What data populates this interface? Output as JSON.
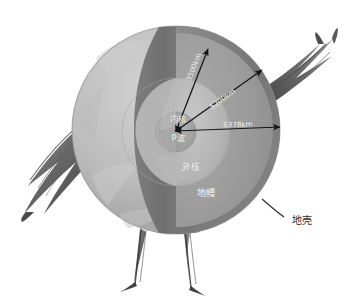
{
  "figure": {
    "style": "hand-drawn pencil sketch, grayscale",
    "background_color": "#ffffff"
  },
  "layers": [
    {
      "id": "crust",
      "label": "地壳",
      "color": "#7b7b7b",
      "label_color": "#3a3a3a"
    },
    {
      "id": "mantle",
      "label": "地幔",
      "color": "#9a9a9a",
      "label_color": "#ffffff"
    },
    {
      "id": "outer_core",
      "label": "外核",
      "color": "#b4b4b4",
      "label_color": "#ffffff"
    },
    {
      "id": "inner_core",
      "label": "内核",
      "color": "#a2a2a2",
      "label_color": "#ffffff"
    }
  ],
  "wave_labels": [
    {
      "id": "p_wave",
      "label": "P波",
      "color": "#ffffff"
    }
  ],
  "measurements": [
    {
      "id": "inner_core_radius",
      "label": "3500km",
      "color": "#ffffff"
    },
    {
      "id": "outer_core_radius",
      "label": "5200km",
      "color": "#ffffff"
    },
    {
      "id": "earth_radius",
      "label": "6378km",
      "color": "#ffffff"
    }
  ],
  "decorations": [
    {
      "id": "left-wing",
      "name": "wing"
    },
    {
      "id": "right-wing",
      "name": "wing"
    },
    {
      "id": "left-leg",
      "name": "leg"
    },
    {
      "id": "right-leg",
      "name": "leg"
    }
  ],
  "colors": {
    "sphere_light": "#c2c2c2",
    "sphere_mid": "#adadad",
    "sphere_dark": "#8a8a8a",
    "crust_band": "#7a7a7a",
    "cut_face_mantle": "#9c9c9c",
    "cut_face_outer": "#b6b6b6",
    "cut_face_inner": "#a0a0a0",
    "arrow": "#1a1a1a",
    "limb_dark": "#4a4a4a",
    "outline": "#6e6e6e"
  }
}
